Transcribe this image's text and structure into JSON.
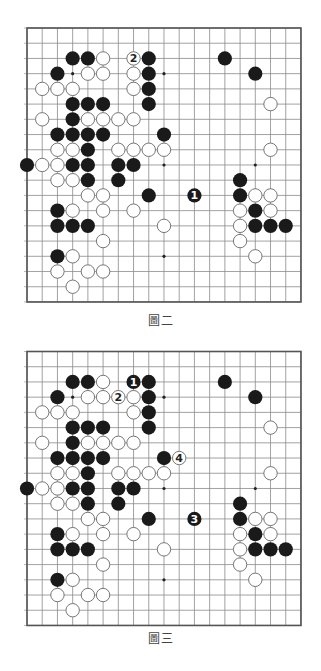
{
  "colors": {
    "grid": "#8a8a8a",
    "border": "#555555",
    "black_stone": "#1a1a1a",
    "white_stone_fill": "#ffffff",
    "white_stone_stroke": "#666666",
    "label_on_black": "#ffffff",
    "label_on_white": "#222222"
  },
  "boards": [
    {
      "caption": "圖二",
      "size": 19,
      "star_points": [
        [
          3,
          3
        ],
        [
          3,
          9
        ],
        [
          9,
          9
        ],
        [
          9,
          15
        ],
        [
          15,
          9
        ]
      ],
      "black": [
        [
          2,
          3
        ],
        [
          2,
          4
        ],
        [
          2,
          8
        ],
        [
          2,
          13
        ],
        [
          3,
          2
        ],
        [
          3,
          8
        ],
        [
          3,
          15
        ],
        [
          4,
          8
        ],
        [
          5,
          3
        ],
        [
          5,
          4
        ],
        [
          5,
          5
        ],
        [
          5,
          8
        ],
        [
          6,
          3
        ],
        [
          7,
          2
        ],
        [
          7,
          3
        ],
        [
          7,
          4
        ],
        [
          7,
          5
        ],
        [
          7,
          9
        ],
        [
          8,
          4
        ],
        [
          9,
          0
        ],
        [
          9,
          3
        ],
        [
          9,
          4
        ],
        [
          9,
          6
        ],
        [
          9,
          7
        ],
        [
          10,
          4
        ],
        [
          10,
          6
        ],
        [
          10,
          14
        ],
        [
          11,
          8
        ],
        [
          11,
          14
        ],
        [
          12,
          2
        ],
        [
          12,
          15
        ],
        [
          13,
          2
        ],
        [
          13,
          3
        ],
        [
          13,
          4
        ],
        [
          13,
          15
        ],
        [
          13,
          16
        ],
        [
          13,
          17
        ],
        [
          15,
          2
        ]
      ],
      "white": [
        [
          2,
          5
        ],
        [
          3,
          4
        ],
        [
          3,
          5
        ],
        [
          3,
          7
        ],
        [
          4,
          1
        ],
        [
          4,
          2
        ],
        [
          4,
          3
        ],
        [
          4,
          7
        ],
        [
          5,
          16
        ],
        [
          6,
          1
        ],
        [
          6,
          4
        ],
        [
          6,
          5
        ],
        [
          6,
          6
        ],
        [
          6,
          7
        ],
        [
          8,
          2
        ],
        [
          8,
          3
        ],
        [
          8,
          6
        ],
        [
          8,
          7
        ],
        [
          8,
          8
        ],
        [
          8,
          9
        ],
        [
          8,
          16
        ],
        [
          9,
          1
        ],
        [
          9,
          2
        ],
        [
          10,
          2
        ],
        [
          10,
          3
        ],
        [
          11,
          4
        ],
        [
          11,
          5
        ],
        [
          11,
          15
        ],
        [
          11,
          16
        ],
        [
          12,
          3
        ],
        [
          12,
          5
        ],
        [
          12,
          7
        ],
        [
          12,
          14
        ],
        [
          12,
          16
        ],
        [
          13,
          9
        ],
        [
          13,
          14
        ],
        [
          14,
          5
        ],
        [
          14,
          14
        ],
        [
          15,
          3
        ],
        [
          15,
          15
        ],
        [
          16,
          2
        ],
        [
          16,
          4
        ],
        [
          16,
          5
        ],
        [
          17,
          3
        ]
      ],
      "numbered": [
        {
          "row": 11,
          "col": 11,
          "color": "black",
          "label": "1"
        },
        {
          "row": 2,
          "col": 7,
          "color": "white",
          "label": "2"
        }
      ]
    },
    {
      "caption": "圖三",
      "size": 19,
      "star_points": [
        [
          3,
          3
        ],
        [
          3,
          9
        ],
        [
          9,
          9
        ],
        [
          9,
          15
        ],
        [
          15,
          9
        ]
      ],
      "black": [
        [
          2,
          3
        ],
        [
          2,
          4
        ],
        [
          2,
          8
        ],
        [
          2,
          13
        ],
        [
          3,
          2
        ],
        [
          3,
          8
        ],
        [
          3,
          15
        ],
        [
          4,
          8
        ],
        [
          5,
          3
        ],
        [
          5,
          4
        ],
        [
          5,
          5
        ],
        [
          5,
          8
        ],
        [
          6,
          3
        ],
        [
          7,
          2
        ],
        [
          7,
          3
        ],
        [
          7,
          4
        ],
        [
          7,
          5
        ],
        [
          7,
          9
        ],
        [
          8,
          4
        ],
        [
          9,
          0
        ],
        [
          9,
          3
        ],
        [
          9,
          4
        ],
        [
          9,
          6
        ],
        [
          9,
          7
        ],
        [
          10,
          4
        ],
        [
          10,
          6
        ],
        [
          10,
          14
        ],
        [
          11,
          8
        ],
        [
          11,
          14
        ],
        [
          12,
          2
        ],
        [
          12,
          15
        ],
        [
          13,
          2
        ],
        [
          13,
          3
        ],
        [
          13,
          4
        ],
        [
          13,
          15
        ],
        [
          13,
          16
        ],
        [
          13,
          17
        ],
        [
          15,
          2
        ]
      ],
      "white": [
        [
          2,
          5
        ],
        [
          3,
          4
        ],
        [
          3,
          5
        ],
        [
          3,
          7
        ],
        [
          4,
          1
        ],
        [
          4,
          2
        ],
        [
          4,
          3
        ],
        [
          4,
          7
        ],
        [
          5,
          16
        ],
        [
          6,
          1
        ],
        [
          6,
          4
        ],
        [
          6,
          5
        ],
        [
          6,
          6
        ],
        [
          6,
          7
        ],
        [
          8,
          2
        ],
        [
          8,
          3
        ],
        [
          8,
          6
        ],
        [
          8,
          7
        ],
        [
          8,
          8
        ],
        [
          8,
          9
        ],
        [
          8,
          16
        ],
        [
          9,
          1
        ],
        [
          9,
          2
        ],
        [
          10,
          2
        ],
        [
          10,
          3
        ],
        [
          11,
          4
        ],
        [
          11,
          5
        ],
        [
          11,
          15
        ],
        [
          11,
          16
        ],
        [
          12,
          3
        ],
        [
          12,
          5
        ],
        [
          12,
          7
        ],
        [
          12,
          14
        ],
        [
          12,
          16
        ],
        [
          13,
          9
        ],
        [
          13,
          14
        ],
        [
          14,
          5
        ],
        [
          14,
          14
        ],
        [
          15,
          3
        ],
        [
          15,
          15
        ],
        [
          16,
          2
        ],
        [
          16,
          4
        ],
        [
          16,
          5
        ],
        [
          17,
          3
        ]
      ],
      "numbered": [
        {
          "row": 2,
          "col": 7,
          "color": "black",
          "label": "1"
        },
        {
          "row": 3,
          "col": 6,
          "color": "white",
          "label": "2"
        },
        {
          "row": 11,
          "col": 11,
          "color": "black",
          "label": "3"
        },
        {
          "row": 7,
          "col": 10,
          "color": "white",
          "label": "4"
        }
      ]
    }
  ]
}
